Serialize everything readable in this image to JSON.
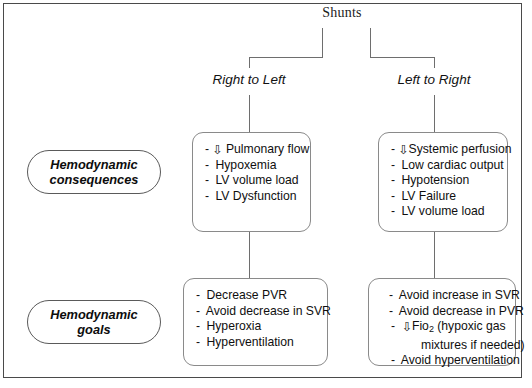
{
  "diagram": {
    "title": "Shunts",
    "branches": [
      {
        "id": "right-to-left",
        "label": "Right to Left"
      },
      {
        "id": "left-to-right",
        "label": "Left to Right"
      }
    ],
    "row_labels": [
      {
        "id": "hemodynamic-consequences",
        "line1": "Hemodynamic",
        "line2": "consequences"
      },
      {
        "id": "hemodynamic-goals",
        "line1": "Hemodynamic",
        "line2": "goals"
      }
    ],
    "boxes": {
      "consequences_right_to_left": {
        "items": [
          {
            "dash": "-",
            "arrow": "⇩",
            "text": "Pulmonary flow"
          },
          {
            "dash": "-",
            "arrow": "",
            "text": "Hypoxemia"
          },
          {
            "dash": "-",
            "arrow": "",
            "text": "LV volume load"
          },
          {
            "dash": "-",
            "arrow": "",
            "text": "LV Dysfunction"
          }
        ]
      },
      "consequences_left_to_right": {
        "items": [
          {
            "dash": "-",
            "arrow": "⇩",
            "text": "Systemic perfusion"
          },
          {
            "dash": "-",
            "arrow": "",
            "text": "Low cardiac output"
          },
          {
            "dash": "-",
            "arrow": "",
            "text": "Hypotension"
          },
          {
            "dash": "-",
            "arrow": "",
            "text": "LV Failure"
          },
          {
            "dash": "-",
            "arrow": "",
            "text": "LV volume load"
          }
        ]
      },
      "goals_right_to_left": {
        "items": [
          {
            "dash": "-",
            "arrow": "",
            "text": "Decrease PVR"
          },
          {
            "dash": "-",
            "arrow": "",
            "text": "Avoid decrease in SVR"
          },
          {
            "dash": "-",
            "arrow": "",
            "text": "Hyperoxia"
          },
          {
            "dash": "-",
            "arrow": "",
            "text": "Hyperventilation"
          }
        ]
      },
      "goals_left_to_right": {
        "items": [
          {
            "dash": "-",
            "arrow": "",
            "text": "Avoid increase in SVR"
          },
          {
            "dash": "-",
            "arrow": "",
            "text": "Avoid decrease in PVR"
          },
          {
            "dash": "-",
            "arrow": "⇩",
            "text_pre": "Fio",
            "subscript": "2",
            "text_post": " (hypoxic gas"
          },
          {
            "dash": "",
            "arrow": "",
            "text": "mixtures if  needed)"
          },
          {
            "dash": "-",
            "arrow": "",
            "text": "Avoid hyperventilation"
          }
        ]
      }
    },
    "colors": {
      "frame_border": "#4a4a4a",
      "connector": "#6e6e6e",
      "box_border": "#8a8a8a",
      "pill_border": "#5a5a5a",
      "text": "#0f0f0f",
      "background": "#ffffff"
    }
  }
}
